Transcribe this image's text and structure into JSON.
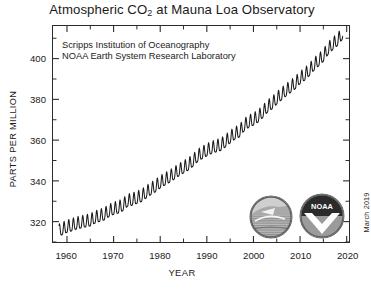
{
  "chart_data": {
    "type": "line",
    "title": "Atmospheric CO2 at Mauna Loa Observatory",
    "title_prefix": "Atmospheric CO",
    "title_subscript": "2",
    "title_suffix": " at Mauna Loa Observatory",
    "xlabel": "YEAR",
    "ylabel": "PARTS PER MILLION",
    "xlim": [
      1957,
      2020.5
    ],
    "ylim": [
      310,
      416
    ],
    "grid": false,
    "legend": "none",
    "annotations": [
      "Scripps Institution of Oceanography",
      "NOAA Earth System Research Laboratory"
    ],
    "date_stamp": "March 2019",
    "xticks": [
      1960,
      1970,
      1980,
      1990,
      2000,
      2010,
      2020
    ],
    "xtick_labels": [
      "1960",
      "1970",
      "1980",
      "1990",
      "2000",
      "2010",
      "2020"
    ],
    "xminor_step": 5,
    "yticks": [
      320,
      340,
      360,
      380,
      400
    ],
    "ytick_labels": [
      "320",
      "340",
      "360",
      "380",
      "400"
    ],
    "yminor_step": 10,
    "series_name": "Monthly mean CO2 (ppm)",
    "seasonal_amplitude_ppm": 6.0,
    "line_color": "#1a1a1a",
    "x": [
      1958.3,
      1959,
      1960,
      1961,
      1962,
      1963,
      1964,
      1965,
      1966,
      1967,
      1968,
      1969,
      1970,
      1971,
      1972,
      1973,
      1974,
      1975,
      1976,
      1977,
      1978,
      1979,
      1980,
      1981,
      1982,
      1983,
      1984,
      1985,
      1986,
      1987,
      1988,
      1989,
      1990,
      1991,
      1992,
      1993,
      1994,
      1995,
      1996,
      1997,
      1998,
      1999,
      2000,
      2001,
      2002,
      2003,
      2004,
      2005,
      2006,
      2007,
      2008,
      2009,
      2010,
      2011,
      2012,
      2013,
      2014,
      2015,
      2016,
      2017,
      2018,
      2019.2
    ],
    "values": [
      315.0,
      315.8,
      316.9,
      317.6,
      318.5,
      319.0,
      319.6,
      320.0,
      321.4,
      322.2,
      323.0,
      324.6,
      325.7,
      326.3,
      327.5,
      329.7,
      330.2,
      331.1,
      332.0,
      333.8,
      335.4,
      336.8,
      338.7,
      340.1,
      341.4,
      343.0,
      344.6,
      346.0,
      347.4,
      349.2,
      351.6,
      353.1,
      354.4,
      355.6,
      356.4,
      357.1,
      358.8,
      360.8,
      362.6,
      363.7,
      366.7,
      368.4,
      369.5,
      371.0,
      373.2,
      375.8,
      377.5,
      379.8,
      381.9,
      383.8,
      385.6,
      387.4,
      389.9,
      391.6,
      393.8,
      396.5,
      398.6,
      400.8,
      404.2,
      406.5,
      408.5,
      412.0
    ],
    "logos": [
      {
        "name": "scripps-logo",
        "alt": "Scripps Institution of Oceanography seal"
      },
      {
        "name": "noaa-logo",
        "alt": "NOAA seal",
        "text": "NOAA"
      }
    ]
  }
}
